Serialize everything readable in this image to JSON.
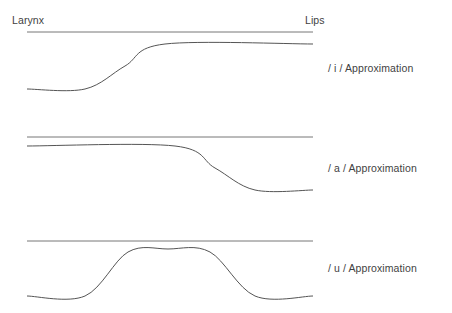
{
  "figure": {
    "axis_labels": {
      "left": "Larynx",
      "right": "Lips"
    },
    "stroke_color": "#777777",
    "curve_color": "#555555",
    "background": "#ffffff",
    "x_start": 27,
    "x_end": 313
  },
  "panels": [
    {
      "id": "i",
      "label": "/ i / Approximation",
      "wall_line_y": 32,
      "curve_description": "low at larynx, rises with S-transition to high plateau near lips",
      "curve_points": [
        {
          "x": 27,
          "y": 89
        },
        {
          "x": 85,
          "y": 89
        },
        {
          "x": 125,
          "y": 66
        },
        {
          "x": 165,
          "y": 44
        },
        {
          "x": 313,
          "y": 44
        }
      ]
    },
    {
      "id": "a",
      "label": "/ a / Approximation",
      "wall_line_y": 137,
      "curve_description": "high at larynx, falls with S-transition to low plateau near lips",
      "curve_points": [
        {
          "x": 27,
          "y": 146
        },
        {
          "x": 175,
          "y": 146
        },
        {
          "x": 215,
          "y": 168
        },
        {
          "x": 255,
          "y": 190
        },
        {
          "x": 313,
          "y": 190
        }
      ]
    },
    {
      "id": "u",
      "label": "/ u / Approximation",
      "wall_line_y": 241,
      "curve_description": "low at larynx, bump peak in mid-tract, returns low near lips",
      "curve_points": [
        {
          "x": 27,
          "y": 296
        },
        {
          "x": 85,
          "y": 296
        },
        {
          "x": 128,
          "y": 252
        },
        {
          "x": 168,
          "y": 249
        },
        {
          "x": 210,
          "y": 252
        },
        {
          "x": 255,
          "y": 296
        },
        {
          "x": 313,
          "y": 296
        }
      ]
    }
  ],
  "chart_data": {
    "type": "line",
    "title": "",
    "xlabel": "",
    "ylabel": "",
    "x_axis_endpoints": [
      "Larynx",
      "Lips"
    ],
    "grid": false,
    "legend": "right",
    "series": [
      {
        "name": "/ i / Approximation wall",
        "x": [
          27,
          313
        ],
        "y": [
          32,
          32
        ]
      },
      {
        "name": "/ i / Approximation tongue",
        "x": [
          27,
          85,
          125,
          165,
          313
        ],
        "y": [
          89,
          89,
          66,
          44,
          44
        ]
      },
      {
        "name": "/ a / Approximation wall",
        "x": [
          27,
          313
        ],
        "y": [
          137,
          137
        ]
      },
      {
        "name": "/ a / Approximation tongue",
        "x": [
          27,
          175,
          215,
          255,
          313
        ],
        "y": [
          146,
          146,
          168,
          190,
          190
        ]
      },
      {
        "name": "/ u / Approximation wall",
        "x": [
          27,
          313
        ],
        "y": [
          241,
          241
        ]
      },
      {
        "name": "/ u / Approximation tongue",
        "x": [
          27,
          85,
          128,
          168,
          210,
          255,
          313
        ],
        "y": [
          296,
          296,
          252,
          249,
          252,
          296,
          296
        ]
      }
    ]
  }
}
